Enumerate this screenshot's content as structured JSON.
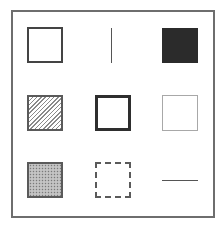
{
  "diagram": {
    "title": "",
    "layout": "3x3 grid of shape style samples inside a square frame",
    "frame": {
      "stroke": "#6e6e6e"
    },
    "cells": [
      {
        "row": 1,
        "col": 1,
        "shape": "square",
        "style": "outline",
        "stroke": "#444444",
        "fill": "#ffffff",
        "label": ""
      },
      {
        "row": 1,
        "col": 2,
        "shape": "vertical-line",
        "style": "solid",
        "stroke": "#555555",
        "label": ""
      },
      {
        "row": 1,
        "col": 3,
        "shape": "square",
        "style": "filled",
        "fill": "#2b2b2b",
        "label": ""
      },
      {
        "row": 2,
        "col": 1,
        "shape": "square",
        "style": "diagonal-hatch",
        "stroke": "#5a5a5a",
        "fill": "#8a8a8a",
        "label": ""
      },
      {
        "row": 2,
        "col": 2,
        "shape": "square",
        "style": "thick-outline",
        "stroke": "#2e2e2e",
        "fill": "#ffffff",
        "label": ""
      },
      {
        "row": 2,
        "col": 3,
        "shape": "square",
        "style": "thin-light-outline",
        "stroke": "#a8a8a8",
        "fill": "#ffffff",
        "label": ""
      },
      {
        "row": 3,
        "col": 1,
        "shape": "square",
        "style": "stippled-fill",
        "stroke": "#5a5a5a",
        "fill": "#b8b8b8",
        "label": ""
      },
      {
        "row": 3,
        "col": 2,
        "shape": "square",
        "style": "dashed-outline",
        "stroke": "#5a5a5a",
        "fill": "#ffffff",
        "label": ""
      },
      {
        "row": 3,
        "col": 3,
        "shape": "horizontal-line",
        "style": "solid",
        "stroke": "#555555",
        "label": ""
      }
    ]
  }
}
